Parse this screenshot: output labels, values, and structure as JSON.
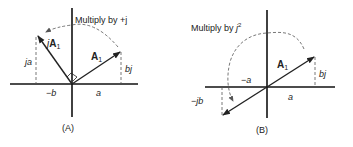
{
  "panels": [
    {
      "id": "A",
      "caption": "(A)",
      "title": "Multiply by +j",
      "vectors": [
        {
          "label": "A",
          "subscript": "1",
          "prefix": ""
        },
        {
          "label": "A",
          "subscript": "1",
          "prefix": "j"
        }
      ],
      "labels": {
        "ja": "ja",
        "bj": "bj",
        "neg_b": "−b",
        "a": "a"
      }
    },
    {
      "id": "B",
      "caption": "(B)",
      "title_prefix": "Multiply by ",
      "title_base": "j",
      "title_exp": "2",
      "vectors": [
        {
          "label": "A",
          "subscript": "1"
        }
      ],
      "labels": {
        "neg_a": "−a",
        "bj": "bj",
        "neg_jb": "−jb",
        "a": "a"
      }
    }
  ],
  "colors": {
    "ink": "#222222",
    "dash": "#555555",
    "background": "#ffffff"
  }
}
